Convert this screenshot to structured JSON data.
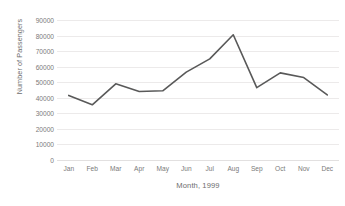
{
  "chart_data": {
    "type": "line",
    "title": "",
    "subtitle": "",
    "xlabel": "Month, 1999",
    "ylabel": "Number of Passengers",
    "categories": [
      "Jan",
      "Feb",
      "Mar",
      "Apr",
      "May",
      "Jun",
      "Jul",
      "Aug",
      "Sep",
      "Oct",
      "Nov",
      "Dec"
    ],
    "values": [
      41500,
      35500,
      49000,
      44000,
      44500,
      56500,
      65000,
      80500,
      46500,
      56000,
      53000,
      41800
    ],
    "series": [
      {
        "name": "Number of Passengers",
        "values": [
          41500,
          35500,
          49000,
          44000,
          44500,
          56500,
          65000,
          80500,
          46500,
          56000,
          53000,
          41800
        ]
      }
    ],
    "ylim": [
      0,
      90000
    ],
    "ytick_values": [
      0,
      10000,
      20000,
      30000,
      40000,
      50000,
      60000,
      70000,
      80000,
      90000
    ],
    "ytick_labels": [
      "0",
      "10000",
      "20000",
      "30000",
      "40000",
      "50000",
      "60000",
      "70000",
      "80000",
      "90000"
    ],
    "grid": true,
    "grid_axis": "y",
    "legend": false,
    "legend_position": "none",
    "markers": false,
    "line_color": "#595959",
    "line_width": 1.6,
    "gridline_color": "#eceaea",
    "tick_label_color": "#7a7a7a",
    "axis_title_color": "#6d6d6d",
    "background_color": "#ffffff"
  }
}
